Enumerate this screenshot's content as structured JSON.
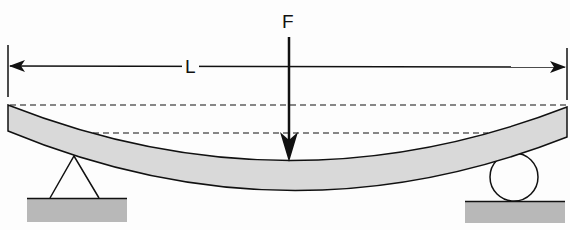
{
  "diagram": {
    "labels": {
      "force": "F",
      "length": "L"
    },
    "colors": {
      "beam_fill": "#d9d9d9",
      "ground_fill": "#b8b8b8",
      "stroke": "#111111",
      "background": "#fdfdfd"
    },
    "elements": [
      {
        "name": "beam",
        "description": "deflected beam (curved)"
      },
      {
        "name": "force-arrow",
        "description": "downward force at midspan"
      },
      {
        "name": "length-dimension",
        "description": "span length L with arrows"
      },
      {
        "name": "pin-support",
        "description": "triangle support at left"
      },
      {
        "name": "roller-support",
        "description": "circle roller at right"
      },
      {
        "name": "undeflected-reference-line",
        "description": "dashed line at original beam top"
      },
      {
        "name": "deflection-reference-line",
        "description": "dashed line at deflected level"
      }
    ]
  }
}
